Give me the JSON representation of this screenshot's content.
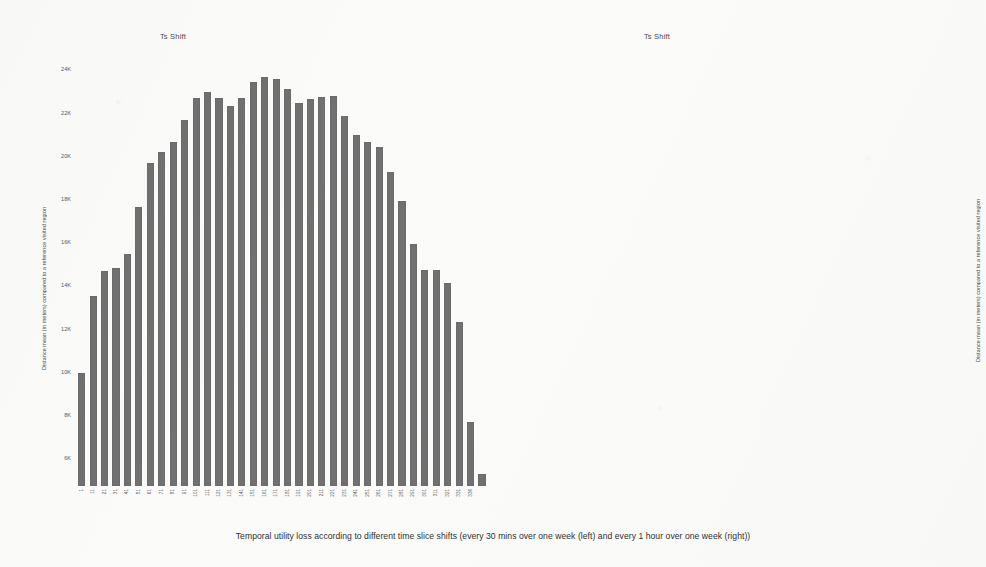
{
  "caption": "Temporal utility loss according to different time slice shifts (every 30 mins over one week (left) and every 1 hour over one week (right))",
  "panels": [
    {
      "id": "left",
      "title": "Ts Shift",
      "ylabel": "Distance mean (in meters) compared to a reference visited region"
    },
    {
      "id": "right",
      "title": "Ts Shift",
      "ylabel": "Distance mean (in meters) compared to a reference visited region"
    }
  ],
  "chart_data": [
    {
      "type": "bar",
      "title": "Ts Shift",
      "xlabel": "Ts Shift",
      "ylabel": "Distance mean (in meters) compared to a reference visited region",
      "ylim": [
        5000,
        24800
      ],
      "yticks": [
        6000,
        8000,
        10000,
        12000,
        14000,
        16000,
        18000,
        20000,
        22000,
        24000
      ],
      "ytick_labels": [
        "6K",
        "8K",
        "10K",
        "12K",
        "14K",
        "16K",
        "18K",
        "20K",
        "22K",
        "24K"
      ],
      "grid": false,
      "legend": false,
      "bar_color": "#707070",
      "categories": [
        "1",
        "11",
        "21",
        "31",
        "41",
        "51",
        "61",
        "71",
        "81",
        "91",
        "101",
        "111",
        "121",
        "131",
        "141",
        "151",
        "161",
        "171",
        "181",
        "191",
        "201",
        "211",
        "221",
        "231",
        "241",
        "251",
        "261",
        "271",
        "281",
        "291",
        "301",
        "311",
        "321",
        "331",
        "336"
      ],
      "x": [
        "1",
        "11",
        "21",
        "31",
        "41",
        "51",
        "61",
        "71",
        "81",
        "91",
        "101",
        "111",
        "121",
        "131",
        "141",
        "151",
        "161",
        "171",
        "181",
        "191",
        "201",
        "211",
        "221",
        "231",
        "241",
        "251",
        "261",
        "271",
        "281",
        "291",
        "301",
        "311",
        "321",
        "331",
        "336"
      ],
      "values": [
        10250,
        13800,
        14950,
        15100,
        15750,
        17900,
        19950,
        20450,
        20900,
        21950,
        22950,
        23250,
        22950,
        22600,
        22950,
        23700,
        23900,
        23850,
        23350,
        22700,
        22900,
        23000,
        23050,
        22100,
        21250,
        20900,
        20700,
        19550,
        18200,
        16200,
        15000,
        15000,
        14400,
        12600,
        7950,
        5550
      ]
    },
    {
      "type": "bar",
      "title": "Ts Shift",
      "xlabel": "Ts Shift",
      "ylabel": "Distance mean (in meters) compared to a reference visited region",
      "ylim": [
        5000,
        23200
      ],
      "yticks": [
        6000,
        8000,
        10000,
        12000,
        14000,
        16000,
        18000,
        20000,
        22000
      ],
      "ytick_labels": [
        "6K",
        "8K",
        "10K",
        "12K",
        "14K",
        "16K",
        "18K",
        "20K",
        "22K"
      ],
      "grid": false,
      "legend": false,
      "bar_color": "#707070",
      "categories": [
        "6",
        "11",
        "16",
        "21",
        "26",
        "31",
        "36",
        "41",
        "46",
        "51",
        "56",
        "61",
        "66",
        "71",
        "76",
        "81",
        "86",
        "91",
        "96",
        "101",
        "106",
        "111",
        "116",
        "121",
        "126",
        "131",
        "136",
        "141",
        "146",
        "151",
        "156",
        "161",
        "166"
      ],
      "x": [
        "6",
        "11",
        "16",
        "21",
        "26",
        "31",
        "36",
        "41",
        "46",
        "51",
        "56",
        "61",
        "66",
        "71",
        "76",
        "81",
        "86",
        "91",
        "96",
        "101",
        "106",
        "111",
        "116",
        "121",
        "126",
        "131",
        "136",
        "141",
        "146",
        "151",
        "156",
        "161",
        "166"
      ],
      "values": [
        10150,
        12800,
        13900,
        13950,
        14600,
        15900,
        17450,
        18800,
        19200,
        19500,
        20800,
        21800,
        22050,
        21700,
        21400,
        21850,
        22500,
        22500,
        21900,
        22150,
        22300,
        22500,
        22500,
        21350,
        20400,
        20100,
        19800,
        19000,
        17550,
        17350,
        17250,
        16800,
        13050,
        11250,
        6450,
        5500
      ]
    }
  ]
}
